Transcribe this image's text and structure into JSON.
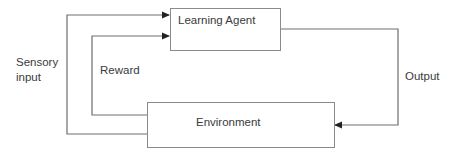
{
  "diagram": {
    "nodes": [
      {
        "id": "agent",
        "label": "Learning Agent"
      },
      {
        "id": "env",
        "label": "Environment"
      }
    ],
    "edges": [
      {
        "from": "env",
        "to": "agent",
        "label": "Sensory input"
      },
      {
        "from": "env",
        "to": "agent",
        "label": "Reward"
      },
      {
        "from": "agent",
        "to": "env",
        "label": "Output"
      }
    ]
  },
  "labels": {
    "sensory_line1": "Sensory",
    "sensory_line2": "input",
    "reward": "Reward",
    "output": "Output"
  },
  "colors": {
    "line": "#6e6e6e",
    "border": "#8a8a8a"
  }
}
